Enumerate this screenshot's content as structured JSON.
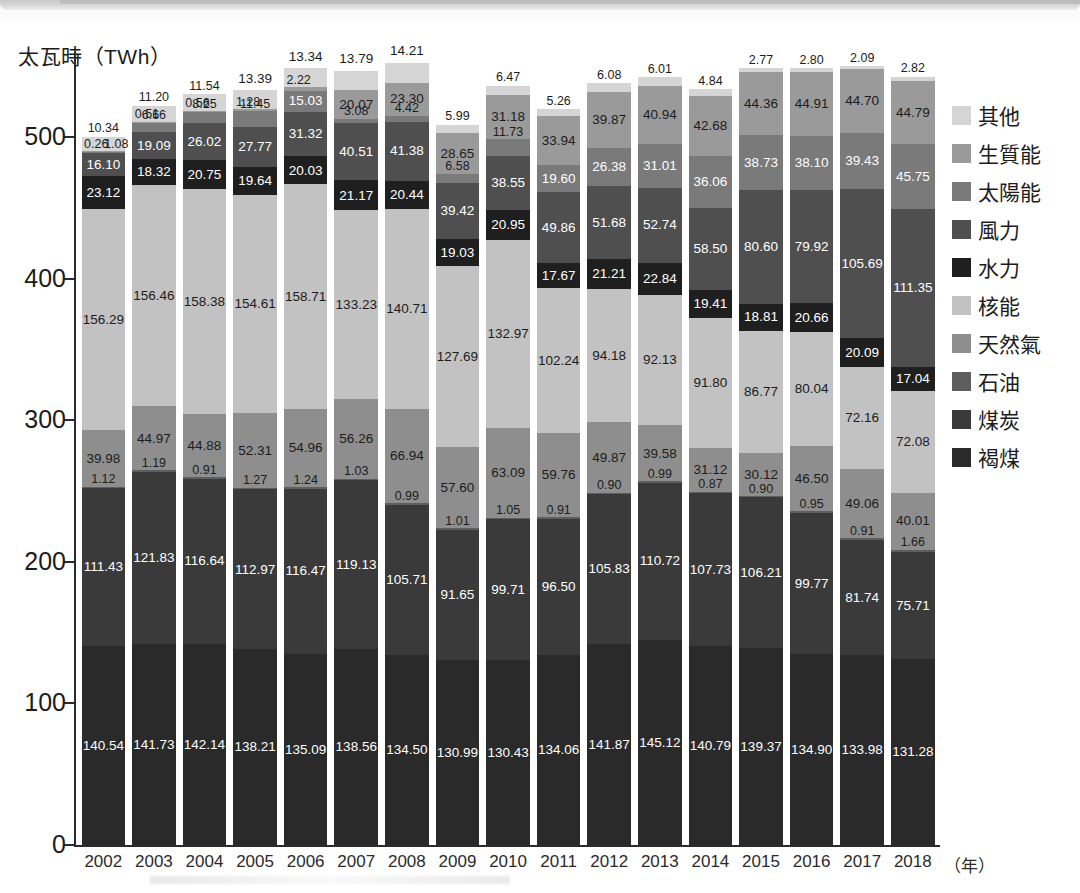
{
  "figure": {
    "ylabel": "太瓦時（TWh）",
    "xunit": "（年）",
    "yticks": [
      "0",
      "100",
      "200",
      "300",
      "400",
      "500"
    ],
    "ytick_values": [
      0,
      100,
      200,
      300,
      400,
      500
    ]
  },
  "legend": {
    "items": [
      {
        "label": "其他",
        "color": "#d5d5d5"
      },
      {
        "label": "生質能",
        "color": "#9a9a9a"
      },
      {
        "label": "太陽能",
        "color": "#7a7a7a"
      },
      {
        "label": "風力",
        "color": "#4f4f4f"
      },
      {
        "label": "水力",
        "color": "#1f1f1f"
      },
      {
        "label": "核能",
        "color": "#c2c2c2"
      },
      {
        "label": "天然氣",
        "color": "#8e8e8e"
      },
      {
        "label": "石油",
        "color": "#5e5e5e"
      },
      {
        "label": "煤炭",
        "color": "#3a3a3a"
      },
      {
        "label": "褐煤",
        "color": "#2a2a2a"
      }
    ]
  },
  "chart_data": {
    "type": "bar",
    "subtype": "stacked",
    "title": "",
    "xlabel": "（年）",
    "ylabel": "太瓦時（TWh）",
    "ylim": [
      0,
      560
    ],
    "yticks": [
      0,
      100,
      200,
      300,
      400,
      500
    ],
    "grid": false,
    "legend_position": "right",
    "categories": [
      "2002",
      "2003",
      "2004",
      "2005",
      "2006",
      "2007",
      "2008",
      "2009",
      "2010",
      "2011",
      "2012",
      "2013",
      "2014",
      "2015",
      "2016",
      "2017",
      "2018"
    ],
    "stack_order_bottom_to_top": [
      "褐煤",
      "煤炭",
      "石油",
      "天然氣",
      "核能",
      "水力",
      "風力",
      "太陽能",
      "生質能",
      "其他"
    ],
    "series": [
      {
        "name": "褐煤",
        "color": "#2a2a2a",
        "values": [
          140.54,
          141.73,
          142.14,
          138.21,
          135.09,
          138.56,
          134.5,
          130.99,
          130.43,
          134.06,
          141.87,
          145.12,
          140.79,
          139.37,
          134.9,
          133.98,
          131.28
        ]
      },
      {
        "name": "煤炭",
        "color": "#3a3a3a",
        "values": [
          111.43,
          121.83,
          116.64,
          112.97,
          116.47,
          119.13,
          105.71,
          91.65,
          99.71,
          96.5,
          105.83,
          110.72,
          107.73,
          106.21,
          99.77,
          81.74,
          75.71
        ]
      },
      {
        "name": "石油",
        "color": "#5e5e5e",
        "values": [
          1.12,
          1.19,
          0.91,
          1.27,
          1.24,
          1.03,
          0.99,
          1.01,
          1.05,
          0.91,
          0.9,
          0.99,
          0.87,
          0.9,
          0.95,
          0.91,
          1.66
        ]
      },
      {
        "name": "天然氣",
        "color": "#8e8e8e",
        "values": [
          39.98,
          44.97,
          44.88,
          52.31,
          54.96,
          56.26,
          66.94,
          57.6,
          63.09,
          59.76,
          49.87,
          39.58,
          31.12,
          30.12,
          46.5,
          49.06,
          40.01
        ]
      },
      {
        "name": "核能",
        "color": "#c2c2c2",
        "values": [
          156.29,
          156.46,
          158.38,
          154.61,
          158.71,
          133.23,
          140.71,
          127.69,
          132.97,
          102.24,
          94.18,
          92.13,
          91.8,
          86.77,
          80.04,
          72.16,
          72.08
        ]
      },
      {
        "name": "水力",
        "color": "#1f1f1f",
        "values": [
          23.12,
          18.32,
          20.75,
          19.64,
          20.03,
          21.17,
          20.44,
          19.03,
          20.95,
          17.67,
          21.21,
          22.84,
          19.41,
          18.81,
          20.66,
          20.09,
          17.04
        ]
      },
      {
        "name": "風力",
        "color": "#4f4f4f",
        "values": [
          16.1,
          19.09,
          26.02,
          27.77,
          31.32,
          40.51,
          41.38,
          39.42,
          38.55,
          49.86,
          51.68,
          52.74,
          58.5,
          80.6,
          79.92,
          105.69,
          111.35
        ]
      },
      {
        "name": "太陽能",
        "color": "#7a7a7a",
        "values": [
          1.08,
          6.66,
          8.25,
          11.45,
          15.03,
          3.08,
          4.42,
          6.58,
          11.73,
          19.6,
          26.38,
          31.01,
          36.06,
          38.73,
          38.1,
          39.43,
          45.75
        ]
      },
      {
        "name": "生質能",
        "color": "#9a9a9a",
        "values": [
          0.26,
          0.51,
          0.56,
          1.28,
          2.22,
          20.07,
          23.3,
          28.65,
          31.18,
          33.94,
          39.87,
          40.94,
          42.68,
          44.36,
          44.91,
          44.7,
          44.79
        ]
      },
      {
        "name": "其他",
        "color": "#d5d5d5",
        "values": [
          10.34,
          11.2,
          11.54,
          13.39,
          13.34,
          13.79,
          14.21,
          5.99,
          6.47,
          5.26,
          6.08,
          6.01,
          4.84,
          2.77,
          2.8,
          2.09,
          2.82
        ]
      }
    ],
    "totals": [
      500.26,
      522.96,
      530.07,
      532.9,
      548.41,
      546.83,
      552.6,
      508.61,
      536.13,
      519.3,
      537.89,
      542.08,
      533.8,
      548.67,
      548.55,
      549.85,
      542.49
    ]
  }
}
